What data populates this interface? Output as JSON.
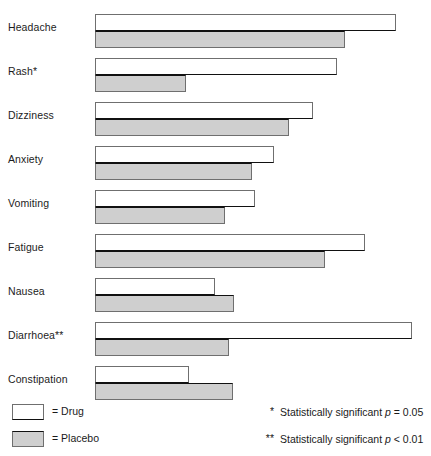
{
  "chart_data": {
    "type": "bar",
    "orientation": "horizontal",
    "title": "",
    "xlabel": "",
    "ylabel": "",
    "grid": false,
    "axis_ticks_visible": false,
    "xlim": [
      0,
      100
    ],
    "categories": [
      "Headache",
      "Rash*",
      "Dizziness",
      "Anxiety",
      "Vomiting",
      "Fatigue",
      "Nausea",
      "Diarrhoea**",
      "Constipation"
    ],
    "series": [
      {
        "name": "Drug",
        "color": "#ffffff",
        "values": [
          94.0,
          75.5,
          68.0,
          56.0,
          50.0,
          84.5,
          37.5,
          99.0,
          29.5
        ]
      },
      {
        "name": "Placebo",
        "color": "#cfcfcf",
        "values": [
          78.0,
          28.5,
          60.5,
          49.0,
          40.5,
          72.0,
          43.5,
          42.0,
          43.0
        ]
      }
    ],
    "legend_position": "bottom-left",
    "annotations": [
      "* Statistically significant p = 0.05",
      "** Statistically significant p < 0.01"
    ]
  },
  "legend": {
    "items": [
      {
        "swatch": "drug",
        "label": "= Drug"
      },
      {
        "swatch": "placebo",
        "label": "= Placebo"
      }
    ]
  },
  "footnotes": [
    {
      "mark": "*",
      "prefix": "Statistically significant ",
      "symbol": "p",
      "suffix": " = 0.05"
    },
    {
      "mark": "**",
      "prefix": "Statistically significant ",
      "symbol": "p",
      "suffix": " < 0.01"
    }
  ],
  "geometry": {
    "bar_origin_x": 95,
    "bar_max_width": 320,
    "row_top_start": 11,
    "row_pitch": 44
  }
}
